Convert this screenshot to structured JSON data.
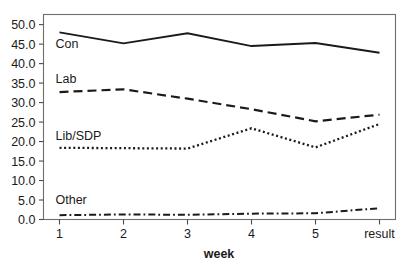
{
  "chart_data": {
    "type": "line",
    "title": "",
    "subtitle": "",
    "xlabel": "week",
    "ylabel": "",
    "categories": [
      "1",
      "2",
      "3",
      "4",
      "5",
      "result"
    ],
    "x_tick_labels": [
      "1",
      "2",
      "3",
      "4",
      "5",
      "result"
    ],
    "y_tick_labels": [
      "0.0",
      "5.0",
      "10.0",
      "15.0",
      "20.0",
      "25.0",
      "30.0",
      "35.0",
      "40.0",
      "45.0",
      "50.0"
    ],
    "y_tick_values": [
      0,
      5,
      10,
      15,
      20,
      25,
      30,
      35,
      40,
      45,
      50
    ],
    "ylim": [
      0,
      52
    ],
    "xlim": [
      0,
      5
    ],
    "grid": false,
    "legend_position": "inline-left-above-series",
    "series": [
      {
        "name": "Con",
        "label": "Con",
        "style": "solid",
        "color": "#1a1a1a",
        "values": [
          48.0,
          45.2,
          47.8,
          44.5,
          45.3,
          42.8
        ]
      },
      {
        "name": "Lab",
        "label": "Lab",
        "style": "dashed",
        "color": "#1a1a1a",
        "values": [
          32.7,
          33.4,
          31.0,
          28.3,
          25.2,
          26.9
        ]
      },
      {
        "name": "Lib/SDP",
        "label": "Lib/SDP",
        "style": "dotted",
        "color": "#1a1a1a",
        "values": [
          18.4,
          18.3,
          18.2,
          23.4,
          18.5,
          24.5
        ]
      },
      {
        "name": "Other",
        "label": "Other",
        "style": "dash-dot",
        "color": "#1a1a1a",
        "values": [
          1.1,
          1.3,
          1.2,
          1.5,
          1.6,
          2.9
        ]
      }
    ],
    "series_label_positions": [
      {
        "name": "Con",
        "value": 44.0
      },
      {
        "name": "Lab",
        "value": 35.0
      },
      {
        "name": "Lib/SDP",
        "value": 20.5
      },
      {
        "name": "Other",
        "value": 4.0
      }
    ]
  }
}
